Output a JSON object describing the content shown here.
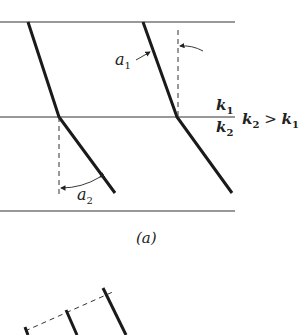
{
  "diagram": {
    "boundary_label_upper": "k",
    "boundary_label_upper_sub": "1",
    "boundary_label_lower": "k",
    "boundary_label_lower_sub": "2",
    "condition": {
      "lhs": "k",
      "lhs_sub": "2",
      "op": " > ",
      "rhs": "k",
      "rhs_sub": "1"
    },
    "angle_upper": {
      "symbol": "a",
      "sub": "1"
    },
    "angle_lower": {
      "symbol": "a",
      "sub": "2"
    },
    "panel_label": "(a)",
    "colors": {
      "line": "#222222",
      "stroke": "#1a1a1a",
      "background": "#ffffff"
    }
  }
}
